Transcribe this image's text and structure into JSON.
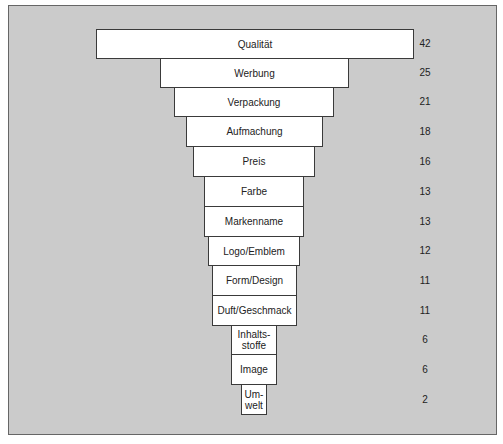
{
  "chart_data": {
    "type": "bar",
    "orientation": "funnel",
    "title": "",
    "xlabel": "",
    "ylabel": "",
    "grid": false,
    "categories": [
      "Qualität",
      "Werbung",
      "Verpackung",
      "Aufmachung",
      "Preis",
      "Farbe",
      "Markenname",
      "Logo/Emblem",
      "Form/Design",
      "Duft/Geschmack",
      "Inhalts-stoffe",
      "Image",
      "Um-welt"
    ],
    "values": [
      42,
      25,
      21,
      18,
      16,
      13,
      13,
      12,
      11,
      11,
      6,
      6,
      2
    ],
    "bars": [
      {
        "label": "Qualität",
        "label_lines": [
          "Qualität"
        ],
        "value": "42",
        "x": 96,
        "y": 29,
        "w": 318,
        "h": 30
      },
      {
        "label": "Werbung",
        "label_lines": [
          "Werbung"
        ],
        "value": "25",
        "x": 160,
        "y": 58,
        "w": 189,
        "h": 30
      },
      {
        "label": "Verpackung",
        "label_lines": [
          "Verpackung"
        ],
        "value": "21",
        "x": 174,
        "y": 87,
        "w": 160,
        "h": 30
      },
      {
        "label": "Aufmachung",
        "label_lines": [
          "Aufmachung"
        ],
        "value": "18",
        "x": 186,
        "y": 116,
        "w": 137,
        "h": 31
      },
      {
        "label": "Preis",
        "label_lines": [
          "Preis"
        ],
        "value": "16",
        "x": 193,
        "y": 146,
        "w": 122,
        "h": 31
      },
      {
        "label": "Farbe",
        "label_lines": [
          "Farbe"
        ],
        "value": "13",
        "x": 204,
        "y": 176,
        "w": 100,
        "h": 31
      },
      {
        "label": "Markenname",
        "label_lines": [
          "Markenname"
        ],
        "value": "13",
        "x": 204,
        "y": 206,
        "w": 100,
        "h": 31
      },
      {
        "label": "Logo/Emblem",
        "label_lines": [
          "Logo/Emblem"
        ],
        "value": "12",
        "x": 208,
        "y": 236,
        "w": 92,
        "h": 30
      },
      {
        "label": "Form/Design",
        "label_lines": [
          "Form/Design"
        ],
        "value": "11",
        "x": 212,
        "y": 265,
        "w": 85,
        "h": 31
      },
      {
        "label": "Duft/Geschmack",
        "label_lines": [
          "Duft/Geschmack"
        ],
        "value": "11",
        "x": 212,
        "y": 295,
        "w": 85,
        "h": 31
      },
      {
        "label": "Inhaltsstoffe",
        "label_lines": [
          "Inhalts-",
          "stoffe"
        ],
        "value": "6",
        "x": 231,
        "y": 325,
        "w": 46,
        "h": 30
      },
      {
        "label": "Image",
        "label_lines": [
          "Image"
        ],
        "value": "6",
        "x": 231,
        "y": 354,
        "w": 46,
        "h": 31
      },
      {
        "label": "Umwelt",
        "label_lines": [
          "Um-",
          "welt"
        ],
        "value": "2",
        "x": 241,
        "y": 384,
        "w": 26,
        "h": 31
      }
    ],
    "value_column_x": 410,
    "colors": {
      "background": "#cbcbcb",
      "bar_fill": "#ffffff",
      "bar_border": "#3a3a3a",
      "text": "#222222"
    }
  }
}
